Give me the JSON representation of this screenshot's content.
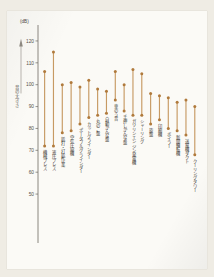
{
  "figure": {
    "unit_label": "(dB)",
    "y_axis_title": "音の大きさ",
    "y_ticks": [
      120,
      110,
      100,
      90,
      80,
      70,
      60,
      50
    ],
    "y_min": 45,
    "y_max": 125,
    "axis_color": "#6e6a63",
    "marker_color": "#b07a3c",
    "stem_color": "#c79a63",
    "paper_color": "#fbfaf6",
    "background_color": "#efece4"
  },
  "chart_data": {
    "type": "bar",
    "title": "音の大きさ",
    "xlabel": "",
    "ylabel": "音の大きさ",
    "unit": "dB",
    "ylim": [
      45,
      125
    ],
    "grid": false,
    "legend": "none",
    "note": "lollipop range chart: each category has a high and low dB value joined by a vertical stem with dots at both ends",
    "categories": [
      "機械プレス",
      "液圧プレス",
      "鋲打・打鋲作業",
      "空気圧縮機",
      "ポータブルグラインダー",
      "カットグラインダー",
      "丸のこ盤",
      "自動かんな盤",
      "車のう音",
      "手押しかんな盤",
      "ガソリンエンジン発電機",
      "シャーリング",
      "旋盤",
      "印刷機",
      "ボイラー",
      "新聞輪転機",
      "送風機ダクト",
      "クーリングタワー"
    ],
    "series": [
      {
        "name": "上限",
        "values": [
          106,
          115,
          100,
          101,
          99,
          102,
          98,
          97,
          106,
          100,
          107,
          105,
          96,
          95,
          94,
          92,
          93,
          90
        ]
      },
      {
        "name": "下限",
        "values": [
          72,
          72,
          78,
          79,
          82,
          85,
          86,
          87,
          93,
          88,
          86,
          86,
          82,
          84,
          80,
          79,
          77,
          68
        ]
      }
    ]
  }
}
